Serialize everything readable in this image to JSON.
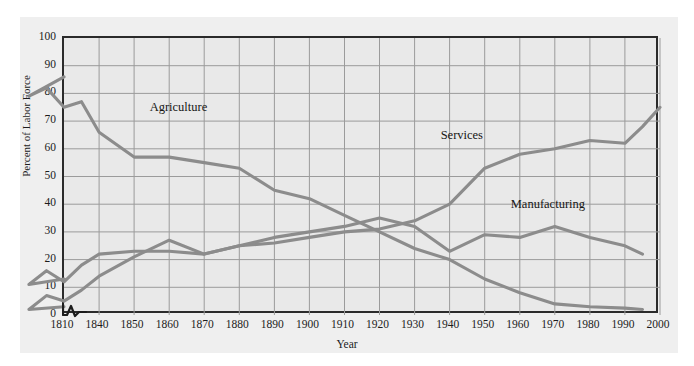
{
  "chart_data": {
    "type": "line",
    "title": "",
    "xlabel": "Year",
    "ylabel": "Percent of Labor Force",
    "xlim": [
      1810,
      2000
    ],
    "ylim": [
      0,
      100
    ],
    "grid": true,
    "legend": "inline-annotations",
    "x_ticks": [
      "1810",
      "1840",
      "1850",
      "1860",
      "1870",
      "1880",
      "1890",
      "1900",
      "1910",
      "1920",
      "1930",
      "1940",
      "1950",
      "1960",
      "1970",
      "1980",
      "1990",
      "2000"
    ],
    "y_ticks": [
      "0",
      "10",
      "20",
      "30",
      "40",
      "50",
      "60",
      "70",
      "80",
      "90",
      "100"
    ],
    "axis_break_after": "1810",
    "line_color": "#8c8c8c",
    "series": [
      {
        "name": "Agriculture",
        "label_x": 1855,
        "label_y": 74,
        "x": [
          1810,
          1820,
          1825,
          1830,
          1835,
          1840,
          1850,
          1860,
          1870,
          1880,
          1890,
          1900,
          1910,
          1920,
          1930,
          1940,
          1950,
          1960,
          1970,
          1980,
          1990,
          1995
        ],
        "values": [
          86,
          79,
          82,
          75,
          77,
          66,
          57,
          57,
          55,
          53,
          45,
          42,
          36,
          30,
          24,
          20,
          13,
          8,
          4,
          3,
          2.5,
          2
        ]
      },
      {
        "name": "Services",
        "label_x": 1938,
        "label_y": 64,
        "x": [
          1810,
          1820,
          1825,
          1830,
          1835,
          1840,
          1850,
          1860,
          1870,
          1880,
          1890,
          1900,
          1910,
          1920,
          1930,
          1940,
          1950,
          1960,
          1970,
          1980,
          1990,
          1995
        ],
        "values": [
          13,
          11,
          16,
          12,
          18,
          22,
          23,
          23,
          22,
          25,
          26,
          28,
          30,
          31,
          34,
          40,
          53,
          58,
          60,
          63,
          62,
          68
        ]
      },
      {
        "name": "Manufacturing",
        "label_x": 1958,
        "label_y": 39,
        "x": [
          1810,
          1820,
          1825,
          1830,
          1835,
          1840,
          1850,
          1860,
          1870,
          1880,
          1890,
          1900,
          1910,
          1920,
          1930,
          1940,
          1950,
          1960,
          1970,
          1980,
          1990,
          1995
        ],
        "values": [
          3,
          2,
          7,
          5,
          9,
          14,
          21,
          27,
          22,
          25,
          28,
          30,
          32,
          35,
          32,
          23,
          29,
          28,
          32,
          28,
          25,
          22
        ]
      }
    ],
    "series_extra_tail": {
      "Services": {
        "x": [
          2000
        ],
        "values": [
          75
        ]
      }
    }
  }
}
